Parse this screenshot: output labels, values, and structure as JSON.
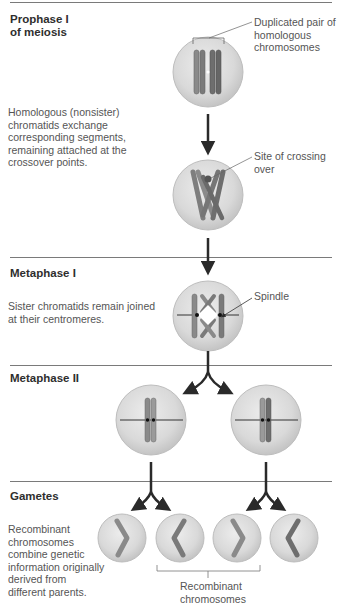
{
  "stages": [
    {
      "title": "Prophase I",
      "subtitle": "of meiosis"
    },
    {
      "title": "Metaphase I"
    },
    {
      "title": "Metaphase II"
    },
    {
      "title": "Gametes"
    }
  ],
  "descriptions": {
    "crossover": [
      "Homologous (nonsister)",
      "chromatids exchange",
      "corresponding segments,",
      "remaining attached at the",
      "crossover points."
    ],
    "metaphase1": [
      "Sister chromatids remain joined",
      "at their centromeres."
    ],
    "gametes": [
      "Recombinant",
      "chromosomes",
      "combine genetic",
      "information originally",
      "derived from",
      "different parents."
    ]
  },
  "labels": {
    "duplicated_pair": [
      "Duplicated pair of",
      "homologous",
      "chromosomes"
    ],
    "crossing_over": "Site of crossing over",
    "spindle": "Spindle",
    "recombinant": [
      "Recombinant",
      "chromosomes"
    ]
  },
  "colors": {
    "rule": "#7a7a7a",
    "cell_fill": "#dcdcdc",
    "cell_edge": "#bdbdbd",
    "chromosome_dark": "#6e6e6e",
    "chromosome_light": "#9a9a9a",
    "arrow": "#2a2a2a"
  }
}
